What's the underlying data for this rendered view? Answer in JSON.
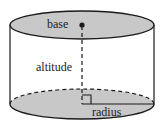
{
  "diagram": {
    "labels": {
      "base": "base",
      "altitude": "altitude",
      "radius": "radius"
    },
    "colors": {
      "fill": "#c8c8c8",
      "stroke": "#1a1a1a",
      "background": "#ffffff"
    }
  }
}
